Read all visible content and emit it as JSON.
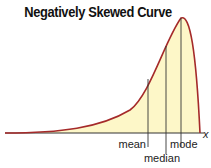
{
  "title": "Negatively Skewed Curve",
  "axis": {
    "x_label": "x"
  },
  "markers": [
    {
      "name": "mean",
      "label": "mean"
    },
    {
      "name": "median",
      "label": "median"
    },
    {
      "name": "mode",
      "label": "mode"
    }
  ],
  "colors": {
    "curve": "#a52a2a",
    "fill": "#fdf7c8",
    "lines": "#333333"
  }
}
